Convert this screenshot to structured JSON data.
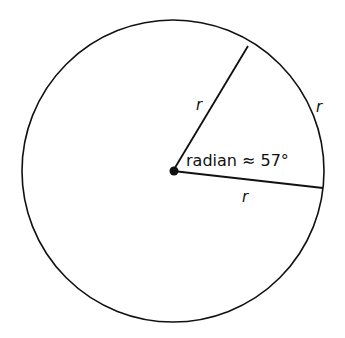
{
  "diagram": {
    "title": "radian",
    "angle_label": "radian ≈ 57°",
    "radius_labels": [
      "r",
      "r",
      "r"
    ],
    "geometry": {
      "center": [
        173,
        171
      ],
      "radius": 151,
      "upper_radius_end": [
        248,
        46
      ],
      "right_radius_end": [
        323,
        188
      ]
    },
    "colors": {
      "stroke": "#111111",
      "background": "#ffffff"
    }
  }
}
